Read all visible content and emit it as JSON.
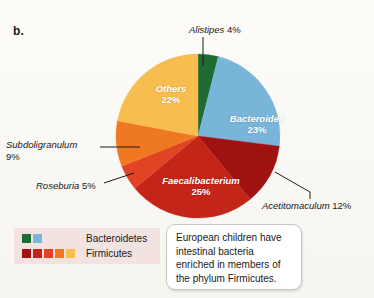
{
  "panel": {
    "label": "b."
  },
  "chart_data": {
    "type": "pie",
    "title": "",
    "legend_position": "bottom-left",
    "total": 100,
    "unit": "%",
    "start_angle_deg": 0,
    "direction": "clockwise",
    "categories": [
      "Alistipes",
      "Bacteroides",
      "Acetitomaculum",
      "Faecalibacterium",
      "Roseburia",
      "Subdoligranulum",
      "Others"
    ],
    "values": [
      4,
      23,
      12,
      25,
      5,
      9,
      22
    ],
    "colors": [
      "#1e6b33",
      "#79b5d9",
      "#9e1212",
      "#c42519",
      "#e04424",
      "#ef7922",
      "#f7bd4e"
    ],
    "phylum": [
      "Bacteroidetes",
      "Bacteroidetes",
      "Firmicutes",
      "Firmicutes",
      "Firmicutes",
      "Firmicutes",
      "Firmicutes"
    ],
    "slices": [
      {
        "name": "Alistipes",
        "value": 4,
        "label": "Alistipes 4%",
        "color": "#1e6b33",
        "placement": "outside",
        "italic": true
      },
      {
        "name": "Bacteroides",
        "value": 23,
        "label": "Bacteroides",
        "pct": "23%",
        "color": "#79b5d9",
        "placement": "inside",
        "italic": true
      },
      {
        "name": "Acetitomaculum",
        "value": 12,
        "label": "Acetitomaculum 12%",
        "color": "#9e1212",
        "placement": "outside",
        "italic": true
      },
      {
        "name": "Faecalibacterium",
        "value": 25,
        "label": "Faecalibacterium",
        "pct": "25%",
        "color": "#c42519",
        "placement": "inside",
        "italic": true
      },
      {
        "name": "Roseburia",
        "value": 5,
        "label": "Roseburia 5%",
        "color": "#e04424",
        "placement": "outside",
        "italic": true
      },
      {
        "name": "Subdoligranulum",
        "value": 9,
        "label": "Subdoligranulum",
        "pct": "9%",
        "color": "#ef7922",
        "placement": "outside",
        "italic": true
      },
      {
        "name": "Others",
        "value": 22,
        "label": "Others",
        "pct": "22%",
        "color": "#f7bd4e",
        "placement": "inside",
        "italic": false
      }
    ]
  },
  "slice_labels": {
    "others": {
      "name": "Others",
      "pct": "22%"
    },
    "bacteroides": {
      "name": "Bacteroides",
      "pct": "23%"
    },
    "faecalibacterium": {
      "name": "Faecalibacterium",
      "pct": "25%"
    }
  },
  "outside_labels": {
    "alistipes": {
      "name": "Alistipes",
      "pct": " 4%"
    },
    "subdoligranulum": {
      "name": "Subdoligranulum",
      "pct": "9%"
    },
    "roseburia": {
      "name": "Roseburia",
      "pct": " 5%"
    },
    "acetitomaculum": {
      "name": "Acetitomaculum",
      "pct": " 12%"
    }
  },
  "legend": {
    "rows": [
      {
        "label": "Bacteroidetes",
        "colors": [
          "#1e6b33",
          "#79b5d9"
        ]
      },
      {
        "label": "Firmicutes",
        "colors": [
          "#9e1212",
          "#c42519",
          "#e04424",
          "#ef7922",
          "#f7bd4e"
        ]
      }
    ],
    "background": "#f2e3e0"
  },
  "callout": {
    "text": "European children have intestinal bacteria enriched in members of the phylum Firmicutes."
  }
}
